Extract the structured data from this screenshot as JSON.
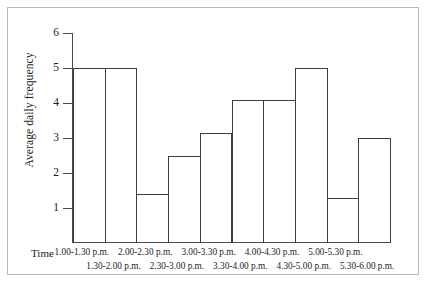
{
  "chart_data": {
    "type": "bar",
    "title": "",
    "xlabel": "Time",
    "ylabel": "Average daily frequency",
    "ylim": [
      0,
      6
    ],
    "ytick_labels": [
      "6",
      "5",
      "4",
      "3",
      "2",
      "1"
    ],
    "yticks": [
      6,
      5,
      4,
      3,
      2,
      1
    ],
    "grid": false,
    "legend": null,
    "categories": [
      "1.00-1.30 p.m.",
      "1.30-2.00 p.m.",
      "2.00-2.30 p.m.",
      "2.30-3.00 p.m.",
      "3.00-3.30 p.m.",
      "3.30-4.00 p.m.",
      "4.00-4.30 p.m.",
      "4.30-5.00 p.m.",
      "5.00-5.30 p.m.",
      "5.30-6.00 p.m."
    ],
    "values": [
      5.0,
      5.0,
      1.4,
      2.5,
      3.15,
      4.1,
      4.1,
      5.0,
      1.3,
      3.0
    ]
  },
  "axes": {
    "y_title": "Average daily frequency",
    "x_title": "Time"
  },
  "x_labels_top_row": [
    "1.00-1.30 p.m.",
    "2.00-2.30 p.m.",
    "3.00-3.30 p.m.",
    "4.00-4.30 p.m.",
    "5.00-5.30 p.m."
  ],
  "x_labels_bottom_row": [
    "1.30-2.00 p.m.",
    "2.30-3.00 p.m.",
    "3.30-4.00 p.m.",
    "4.30-5.00 p.m.",
    "5.30-6.00 p.m."
  ],
  "style": {
    "line_color": "#3d3d3d",
    "axis_color": "#4a4a4a",
    "frame_color": "#b9b9b9",
    "background": "#ffffff",
    "text_color": "#1c1c1c"
  }
}
